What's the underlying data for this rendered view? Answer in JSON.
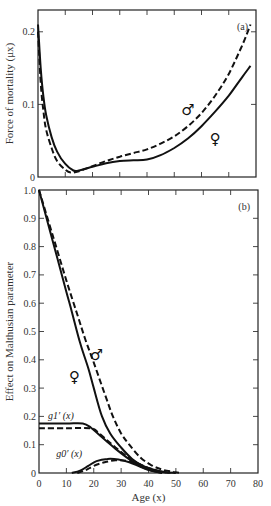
{
  "chart_data": [
    {
      "type": "line",
      "panel_label": "(a)",
      "title": "",
      "xlabel": "",
      "ylabel": "Force of mortality (μx)",
      "xlim": [
        0,
        80
      ],
      "ylim": [
        0,
        0.23
      ],
      "x_ticks": [
        0,
        10,
        20,
        30,
        40,
        50,
        60,
        70,
        80
      ],
      "y_ticks": [
        0,
        0.1,
        0.2
      ],
      "y_tick_labels": [
        "0",
        "0.1",
        "0.2"
      ],
      "grid": false,
      "series": [
        {
          "name": "female",
          "symbol": "♀",
          "style": "solid",
          "x": [
            0,
            1,
            2,
            3,
            5,
            7,
            10,
            13,
            15,
            20,
            25,
            30,
            35,
            40,
            45,
            50,
            55,
            60,
            65,
            70,
            75,
            78
          ],
          "y": [
            0.21,
            0.15,
            0.11,
            0.085,
            0.055,
            0.035,
            0.018,
            0.009,
            0.009,
            0.014,
            0.019,
            0.022,
            0.023,
            0.024,
            0.03,
            0.04,
            0.053,
            0.07,
            0.09,
            0.112,
            0.138,
            0.153
          ]
        },
        {
          "name": "male",
          "symbol": "♂",
          "style": "dashed",
          "x": [
            0,
            1,
            2,
            3,
            5,
            7,
            10,
            12,
            15,
            20,
            25,
            30,
            35,
            40,
            45,
            50,
            55,
            60,
            65,
            70,
            75,
            78
          ],
          "y": [
            0.2,
            0.13,
            0.09,
            0.065,
            0.04,
            0.022,
            0.01,
            0.006,
            0.008,
            0.015,
            0.022,
            0.028,
            0.033,
            0.038,
            0.046,
            0.056,
            0.07,
            0.088,
            0.112,
            0.142,
            0.182,
            0.21
          ]
        }
      ],
      "annotations": [
        {
          "text": "♂",
          "x": 55,
          "y": 0.085
        },
        {
          "text": "♀",
          "x": 65,
          "y": 0.045
        }
      ]
    },
    {
      "type": "line",
      "panel_label": "(b)",
      "title": "",
      "xlabel": "Age (x)",
      "ylabel": "Effect on Malthusian parameter",
      "xlim": [
        0,
        80
      ],
      "ylim": [
        0,
        1.0
      ],
      "x_ticks": [
        0,
        10,
        20,
        30,
        40,
        50,
        60,
        70,
        80
      ],
      "x_tick_labels": [
        "0",
        "10",
        "20",
        "30",
        "40",
        "50",
        "60",
        "70",
        "80"
      ],
      "y_ticks": [
        0,
        0.1,
        0.2,
        0.3,
        0.4,
        0.5,
        0.6,
        0.7,
        0.8,
        0.9,
        1.0
      ],
      "y_tick_labels": [
        "0",
        "0.1",
        "0.2",
        "0.3",
        "0.4",
        "0.5",
        "0.6",
        "0.7",
        "0.8",
        "0.9",
        "1.0"
      ],
      "grid": false,
      "series": [
        {
          "name": "female total",
          "symbol": "♀",
          "style": "solid",
          "x": [
            0,
            5,
            10,
            12,
            15,
            18,
            20,
            23,
            26,
            30,
            34,
            38,
            42,
            46,
            50
          ],
          "y": [
            1.0,
            0.82,
            0.64,
            0.57,
            0.46,
            0.37,
            0.3,
            0.2,
            0.14,
            0.09,
            0.05,
            0.025,
            0.012,
            0.004,
            0.0
          ]
        },
        {
          "name": "male total",
          "symbol": "♂",
          "style": "dashed",
          "x": [
            0,
            5,
            10,
            14,
            17,
            20,
            24,
            27,
            30,
            33,
            37,
            41,
            45,
            49,
            52
          ],
          "y": [
            1.0,
            0.84,
            0.68,
            0.56,
            0.47,
            0.39,
            0.28,
            0.2,
            0.14,
            0.1,
            0.055,
            0.028,
            0.012,
            0.004,
            0.0
          ]
        },
        {
          "name": "g1'(x) female",
          "style": "solid",
          "x": [
            0,
            10,
            16,
            19,
            22,
            25,
            28,
            32,
            36,
            40,
            45
          ],
          "y": [
            0.175,
            0.175,
            0.175,
            0.16,
            0.135,
            0.11,
            0.085,
            0.055,
            0.03,
            0.012,
            0.0
          ]
        },
        {
          "name": "g1'(x) male",
          "style": "dashed",
          "x": [
            0,
            10,
            19,
            22,
            25,
            28,
            32,
            36,
            40,
            45,
            48
          ],
          "y": [
            0.158,
            0.158,
            0.158,
            0.14,
            0.115,
            0.09,
            0.06,
            0.035,
            0.015,
            0.004,
            0.0
          ]
        },
        {
          "name": "g0'(x) female",
          "style": "solid",
          "x": [
            12,
            15,
            18,
            21,
            25,
            29,
            33,
            37,
            41,
            45
          ],
          "y": [
            0.0,
            0.008,
            0.025,
            0.042,
            0.05,
            0.048,
            0.038,
            0.022,
            0.008,
            0.0
          ]
        },
        {
          "name": "g0'(x) male",
          "style": "dashed",
          "x": [
            14,
            17,
            20,
            24,
            28,
            32,
            36,
            40,
            44,
            48
          ],
          "y": [
            0.0,
            0.01,
            0.025,
            0.038,
            0.045,
            0.043,
            0.033,
            0.018,
            0.006,
            0.0
          ]
        }
      ],
      "annotations": [
        {
          "text": "g1′ (x)",
          "x": 8,
          "y": 0.19
        },
        {
          "text": "g0′ (x)",
          "x": 11,
          "y": 0.055
        },
        {
          "text": "♀",
          "x": 13,
          "y": 0.32
        },
        {
          "text": "♂",
          "x": 21,
          "y": 0.4
        }
      ]
    }
  ]
}
